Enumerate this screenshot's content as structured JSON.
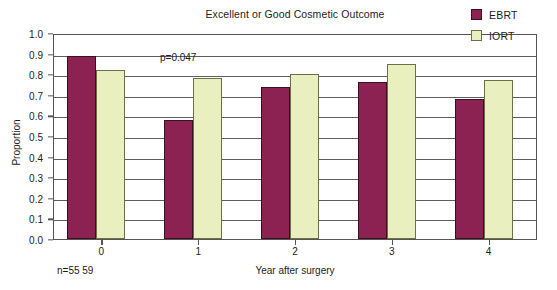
{
  "chart_data": {
    "type": "bar",
    "title": "Excellent or Good Cosmetic Outcome",
    "xlabel": "Year after surgery",
    "ylabel": "Proportion",
    "categories": [
      "0",
      "1",
      "2",
      "3",
      "4"
    ],
    "series": [
      {
        "name": "EBRT",
        "color": "#8B2252",
        "values": [
          0.89,
          0.58,
          0.74,
          0.76,
          0.68
        ]
      },
      {
        "name": "IORT",
        "color": "#EAEFC0",
        "values": [
          0.82,
          0.78,
          0.8,
          0.85,
          0.77
        ]
      }
    ],
    "ylim": [
      0.0,
      1.0
    ],
    "ytick_labels": [
      "0.0",
      "0.1",
      "0.2",
      "0.3",
      "0.4",
      "0.5",
      "0.6",
      "0.7",
      "0.8",
      "0.9",
      "1.0"
    ],
    "ytick_values": [
      0.0,
      0.1,
      0.2,
      0.3,
      0.4,
      0.5,
      0.6,
      0.7,
      0.8,
      0.9,
      1.0
    ],
    "grid": true,
    "legend_position": "top-right",
    "annotations": [
      {
        "text": "p=0.047",
        "category": "1"
      },
      {
        "text": "n=55  59",
        "category": "0"
      }
    ]
  },
  "legend": {
    "entries": [
      {
        "label": "EBRT",
        "color": "#8B2252"
      },
      {
        "label": "IORT",
        "color": "#EAEFC0"
      }
    ]
  }
}
